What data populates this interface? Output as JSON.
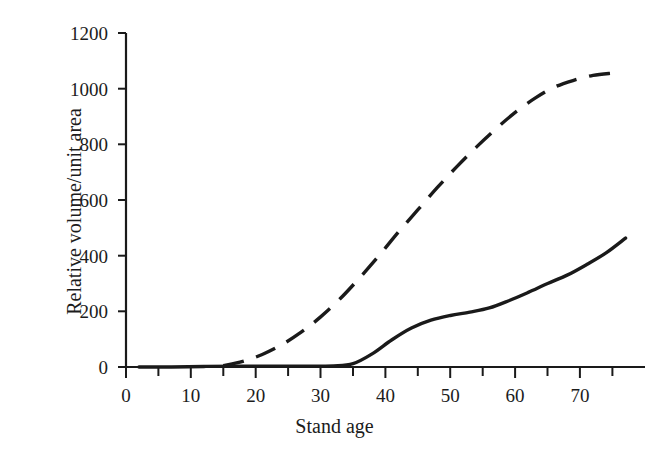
{
  "chart_data": {
    "type": "line",
    "title": "",
    "xlabel": "Stand age",
    "ylabel": "Relative volume/unit area",
    "xlim": [
      -2,
      78
    ],
    "ylim": [
      0,
      1200
    ],
    "grid": false,
    "legend": "none",
    "x_ticks_major": [
      0,
      10,
      20,
      30,
      40,
      50,
      60,
      70
    ],
    "x_ticks_minor": [
      5,
      15,
      25,
      35,
      45,
      55,
      65,
      75
    ],
    "y_ticks_major": [
      0,
      200,
      400,
      600,
      800,
      1000,
      1200
    ],
    "axis_color": "#1a1a1a",
    "series": [
      {
        "name": "dashed-curve",
        "style": "dashed",
        "color": "#1a1a1a",
        "x": [
          13,
          16,
          19,
          22,
          25,
          28,
          31,
          34,
          37,
          40,
          43,
          46,
          49,
          52,
          55,
          58,
          61,
          64,
          67,
          70,
          73
        ],
        "y": [
          5,
          20,
          45,
          80,
          125,
          180,
          245,
          320,
          400,
          485,
          565,
          645,
          720,
          790,
          855,
          915,
          965,
          1005,
          1030,
          1048,
          1056
        ]
      },
      {
        "name": "solid-curve",
        "style": "solid",
        "color": "#1a1a1a",
        "x": [
          0,
          5,
          10,
          15,
          20,
          25,
          30,
          33,
          36,
          39,
          42,
          45,
          48,
          51,
          54,
          57,
          60,
          63,
          66,
          69,
          72,
          75
        ],
        "y": [
          0,
          0,
          2,
          3,
          3,
          3,
          4,
          12,
          48,
          98,
          140,
          168,
          185,
          197,
          212,
          238,
          268,
          300,
          330,
          368,
          410,
          463
        ]
      }
    ]
  },
  "labels": {
    "y_0": "0",
    "y_200": "200",
    "y_400": "400",
    "y_600": "600",
    "y_800": "800",
    "y_1000": "1000",
    "y_1200": "1200",
    "x_0": "0",
    "x_10": "10",
    "x_20": "20",
    "x_30": "30",
    "x_40": "40",
    "x_50": "50",
    "x_60": "60",
    "x_70": "70"
  }
}
